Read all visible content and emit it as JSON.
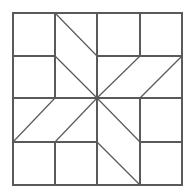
{
  "diagram": {
    "type": "quilt-block",
    "stroke_color": "#5a5a5a",
    "background_color": "#ffffff",
    "stroke_width": 1.2,
    "border": {
      "x1": 13,
      "y1": 13,
      "x2": 182,
      "y2": 185
    },
    "lines": [
      {
        "x1": 55,
        "y1": 13,
        "x2": 55,
        "y2": 98,
        "kind": "straight"
      },
      {
        "x1": 13,
        "y1": 56,
        "x2": 55,
        "y2": 56,
        "kind": "straight"
      },
      {
        "x1": 55,
        "y1": 13,
        "x2": 97,
        "y2": 56,
        "kind": "diag"
      },
      {
        "x1": 55,
        "y1": 56,
        "x2": 97,
        "y2": 98,
        "kind": "diag"
      },
      {
        "x1": 97,
        "y1": 13,
        "x2": 97,
        "y2": 185,
        "kind": "straight"
      },
      {
        "x1": 97,
        "y1": 56,
        "x2": 182,
        "y2": 56,
        "kind": "straight"
      },
      {
        "x1": 140,
        "y1": 13,
        "x2": 140,
        "y2": 56,
        "kind": "straight"
      },
      {
        "x1": 140,
        "y1": 56,
        "x2": 97,
        "y2": 98,
        "kind": "diag"
      },
      {
        "x1": 182,
        "y1": 56,
        "x2": 140,
        "y2": 98,
        "kind": "diag"
      },
      {
        "x1": 13,
        "y1": 98,
        "x2": 182,
        "y2": 98,
        "kind": "straight"
      },
      {
        "x1": 55,
        "y1": 98,
        "x2": 13,
        "y2": 142,
        "kind": "diag"
      },
      {
        "x1": 97,
        "y1": 98,
        "x2": 55,
        "y2": 142,
        "kind": "diag"
      },
      {
        "x1": 13,
        "y1": 142,
        "x2": 97,
        "y2": 142,
        "kind": "straight"
      },
      {
        "x1": 55,
        "y1": 142,
        "x2": 55,
        "y2": 185,
        "kind": "straight"
      },
      {
        "x1": 97,
        "y1": 98,
        "x2": 140,
        "y2": 142,
        "kind": "diag"
      },
      {
        "x1": 97,
        "y1": 142,
        "x2": 140,
        "y2": 185,
        "kind": "diag"
      },
      {
        "x1": 140,
        "y1": 98,
        "x2": 140,
        "y2": 185,
        "kind": "straight"
      },
      {
        "x1": 140,
        "y1": 142,
        "x2": 182,
        "y2": 142,
        "kind": "straight"
      }
    ]
  }
}
